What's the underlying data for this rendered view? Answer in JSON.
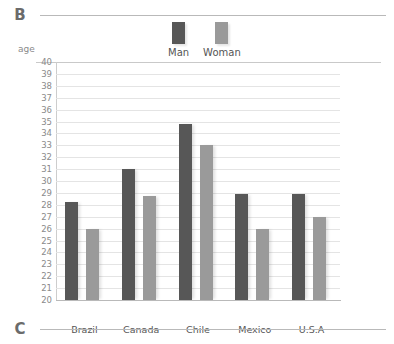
{
  "panels": {
    "b_letter": "B",
    "c_letter": "C"
  },
  "legend": {
    "items": [
      {
        "label": "Man",
        "color": "#575757"
      },
      {
        "label": "Woman",
        "color": "#9a9a9a"
      }
    ]
  },
  "axis": {
    "y_title": "age"
  },
  "chart_data": {
    "type": "bar",
    "title": "",
    "xlabel": "",
    "ylabel": "age",
    "ylim": [
      20,
      40
    ],
    "ytick_step": 1,
    "yticks": [
      40,
      39,
      38,
      37,
      36,
      35,
      34,
      33,
      32,
      31,
      30,
      29,
      28,
      27,
      26,
      25,
      24,
      23,
      22,
      21,
      20
    ],
    "grid": true,
    "legend_position": "top-center",
    "categories": [
      "Brazil",
      "Canada",
      "Chile",
      "Mexico",
      "U.S.A"
    ],
    "series": [
      {
        "name": "Man",
        "color": "#575757",
        "values": [
          28.2,
          31.0,
          34.8,
          28.9,
          28.9
        ]
      },
      {
        "name": "Woman",
        "color": "#9a9a9a",
        "values": [
          26.0,
          28.7,
          33.0,
          26.0,
          27.0
        ]
      }
    ]
  }
}
